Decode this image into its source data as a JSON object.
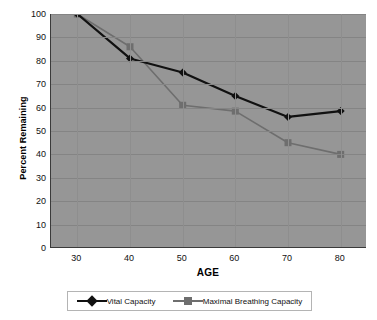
{
  "chart_data": {
    "type": "line",
    "title": "",
    "xlabel": "AGE",
    "ylabel": "Percent Remaining",
    "x": [
      30,
      40,
      50,
      60,
      70,
      80
    ],
    "xticklabels": [
      "30",
      "40",
      "50",
      "60",
      "70",
      "80"
    ],
    "yticklabels": [
      "100",
      "90",
      "80",
      "70",
      "60",
      "50",
      "40",
      "30",
      "20",
      "10",
      "0"
    ],
    "xlim": [
      25,
      85
    ],
    "ylim": [
      0,
      100
    ],
    "grid": "horizontal-and-vertical",
    "legend_position": "bottom",
    "plot_background": "#969696",
    "page_background": "#ffffff",
    "series": [
      {
        "name": "Vital Capacity",
        "color": "#111111",
        "marker": "diamond",
        "values": [
          100,
          81,
          75,
          65,
          56,
          58.5
        ]
      },
      {
        "name": "Maximal Breathing Capacity",
        "color": "#6e6e6e",
        "marker": "square",
        "values": [
          100,
          86,
          61,
          58.5,
          45,
          40
        ]
      }
    ]
  },
  "legend": {
    "items": [
      {
        "label": "Vital Capacity",
        "color": "#111111",
        "marker": "diamond"
      },
      {
        "label": "Maximal Breathing Capacity",
        "color": "#6e6e6e",
        "marker": "square"
      }
    ]
  }
}
